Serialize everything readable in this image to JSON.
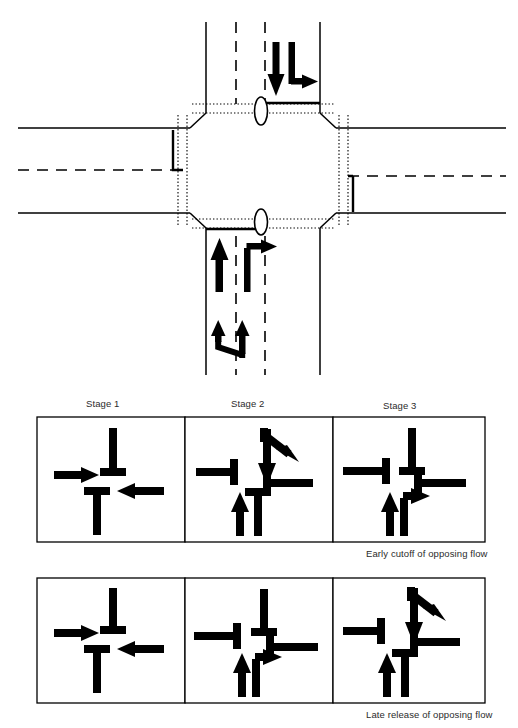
{
  "figure": {
    "kind": "traffic-signal-staging-diagram",
    "intersection": {
      "name": "four-leg-signalised-intersection-plan",
      "approaches": [
        {
          "id": "north-approach",
          "direction": "southbound",
          "markings": [
            {
              "name": "through-arrow",
              "movement": "through",
              "glyph": "arrow-down"
            },
            {
              "name": "left-turn-arrow",
              "movement": "left-turn",
              "glyph": "arrow-down-then-right"
            }
          ],
          "lane_lines": "dashed",
          "stop_line": "solid",
          "island": "oval-pedestrian-refuge"
        },
        {
          "id": "south-approach",
          "direction": "northbound",
          "markings": [
            {
              "name": "through-arrow",
              "movement": "through",
              "glyph": "arrow-up"
            },
            {
              "name": "right-turn-arrow",
              "movement": "right-turn",
              "glyph": "arrow-up-then-right"
            },
            {
              "name": "lane-merge-arrows",
              "movement": "lane-shift",
              "glyph": "double-arrow-up-merge"
            }
          ],
          "lane_lines": "dashed",
          "stop_line": "solid",
          "island": "oval-pedestrian-refuge"
        },
        {
          "id": "west-approach",
          "direction": "eastbound",
          "lane_lines": "dashed-centreline",
          "median_nose": "solid"
        },
        {
          "id": "east-approach",
          "direction": "westbound",
          "lane_lines": "dashed-centreline",
          "median_nose": "solid"
        }
      ],
      "crosswalks": "dotted-lines-all-four-legs",
      "conflict_area": "octagonal"
    },
    "rows": [
      {
        "id": "early-cutoff",
        "caption": "Early cutoff of opposing flow",
        "show_stage_labels": true,
        "panels": [
          {
            "label": "Stage 1",
            "movements": [
              {
                "name": "eastbound-through",
                "glyph": "arrow-right",
                "state": "go"
              },
              {
                "name": "westbound-through",
                "glyph": "arrow-left",
                "state": "go"
              },
              {
                "name": "southbound-stopped",
                "glyph": "bar-down",
                "state": "stop"
              },
              {
                "name": "northbound-stopped",
                "glyph": "bar-up",
                "state": "stop"
              }
            ]
          },
          {
            "label": "Stage 2",
            "movements": [
              {
                "name": "eastbound-stopped",
                "glyph": "bar-right",
                "state": "stop"
              },
              {
                "name": "westbound-stopped",
                "glyph": "bar-left",
                "state": "stop"
              },
              {
                "name": "southbound-through",
                "glyph": "arrow-down",
                "state": "go"
              },
              {
                "name": "southbound-left-turn",
                "glyph": "arrow-diagonal-down-right",
                "state": "go"
              },
              {
                "name": "northbound-through",
                "glyph": "arrow-up",
                "state": "go"
              },
              {
                "name": "northbound-right-stopped",
                "glyph": "bar-up",
                "state": "stop"
              }
            ]
          },
          {
            "label": "Stage 3",
            "movements": [
              {
                "name": "eastbound-stopped",
                "glyph": "bar-right",
                "state": "stop"
              },
              {
                "name": "westbound-stopped",
                "glyph": "bar-left",
                "state": "stop"
              },
              {
                "name": "southbound-stopped",
                "glyph": "bar-down",
                "state": "stop"
              },
              {
                "name": "northbound-through",
                "glyph": "arrow-up",
                "state": "go"
              },
              {
                "name": "northbound-right-turn",
                "glyph": "arrow-up-then-right",
                "state": "go"
              }
            ]
          }
        ]
      },
      {
        "id": "late-release",
        "caption": "Late release of opposing flow",
        "show_stage_labels": false,
        "panels": [
          {
            "label": "Stage 1",
            "movements": [
              {
                "name": "eastbound-through",
                "glyph": "arrow-right",
                "state": "go"
              },
              {
                "name": "westbound-through",
                "glyph": "arrow-left",
                "state": "go"
              },
              {
                "name": "southbound-stopped",
                "glyph": "bar-down",
                "state": "stop"
              },
              {
                "name": "northbound-stopped",
                "glyph": "bar-up",
                "state": "stop"
              }
            ]
          },
          {
            "label": "Stage 2",
            "movements": [
              {
                "name": "eastbound-stopped",
                "glyph": "bar-right",
                "state": "stop"
              },
              {
                "name": "westbound-stopped",
                "glyph": "bar-left",
                "state": "stop"
              },
              {
                "name": "southbound-stopped",
                "glyph": "bar-down",
                "state": "stop"
              },
              {
                "name": "northbound-through",
                "glyph": "arrow-up",
                "state": "go"
              },
              {
                "name": "northbound-right-turn",
                "glyph": "arrow-up-then-right",
                "state": "go"
              }
            ]
          },
          {
            "label": "Stage 3",
            "movements": [
              {
                "name": "eastbound-stopped",
                "glyph": "bar-right",
                "state": "stop"
              },
              {
                "name": "westbound-stopped",
                "glyph": "bar-left",
                "state": "stop"
              },
              {
                "name": "southbound-through",
                "glyph": "arrow-down",
                "state": "go"
              },
              {
                "name": "southbound-left-turn",
                "glyph": "arrow-diagonal-down-right",
                "state": "go"
              },
              {
                "name": "northbound-through",
                "glyph": "arrow-up",
                "state": "go"
              },
              {
                "name": "northbound-stopped",
                "glyph": "bar-up",
                "state": "stop"
              }
            ]
          }
        ]
      }
    ],
    "labels": {
      "stage_1": "Stage 1",
      "stage_2": "Stage 2",
      "stage_3": "Stage 3",
      "caption_row_1": "Early cutoff of opposing flow",
      "caption_row_2": "Late release of opposing flow"
    },
    "colors": {
      "ink": "#000000",
      "text": "#2b2b2b",
      "paper": "#ffffff",
      "panel_border": "#000000"
    }
  }
}
